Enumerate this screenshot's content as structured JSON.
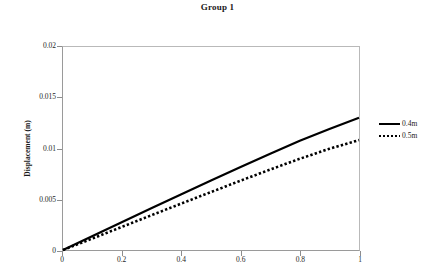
{
  "chart_data": {
    "type": "line",
    "title": "Group 1",
    "xlabel": "",
    "ylabel": "Displacement (m)",
    "xlim": [
      0,
      1
    ],
    "ylim": [
      0,
      0.02
    ],
    "grid": false,
    "legend_position": "right",
    "xticks": [
      "0",
      "0.2",
      "0.4",
      "0.6",
      "0.8",
      "1"
    ],
    "xtick_values": [
      0,
      0.2,
      0.4,
      0.6,
      0.8,
      1
    ],
    "yticks": [
      "0",
      "0.005",
      "0.01",
      "0.015",
      "0.02"
    ],
    "ytick_values": [
      0,
      0.005,
      0.01,
      0.015,
      0.02
    ],
    "x": [
      0,
      0.1,
      0.2,
      0.3,
      0.4,
      0.5,
      0.6,
      0.7,
      0.8,
      0.9,
      1
    ],
    "series": [
      {
        "name": "0.4m",
        "style": "solid",
        "color": "#000000",
        "values": [
          0,
          0.00138,
          0.00276,
          0.00413,
          0.00549,
          0.00684,
          0.00818,
          0.00949,
          0.01077,
          0.01193,
          0.01302
        ]
      },
      {
        "name": "0.5m",
        "style": "dotted",
        "color": "#000000",
        "values": [
          0,
          0.00114,
          0.00229,
          0.00344,
          0.00458,
          0.00571,
          0.00683,
          0.00793,
          0.00899,
          0.00997,
          0.01083
        ]
      }
    ]
  },
  "legend": {
    "items": [
      {
        "label": "0.4m"
      },
      {
        "label": "0.5m"
      }
    ]
  }
}
